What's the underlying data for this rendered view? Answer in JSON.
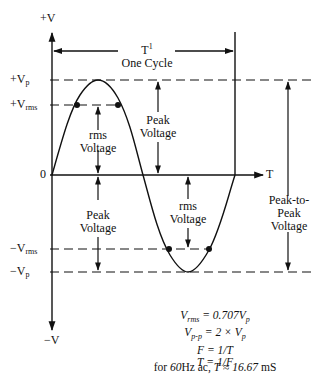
{
  "axes": {
    "y_top": "+V",
    "y_bottom": "−V",
    "x_label": "T",
    "zero": "0"
  },
  "levels": {
    "pos_peak": {
      "prefix": "+V",
      "sub": "p"
    },
    "pos_rms": {
      "prefix": "+V",
      "sub": "rms"
    },
    "neg_rms": {
      "prefix": "−V",
      "sub": "rms"
    },
    "neg_peak": {
      "prefix": "−V",
      "sub": "p"
    }
  },
  "annotations": {
    "cycle_title": "T",
    "cycle_sup": "1",
    "cycle_sub": "One Cycle",
    "rms_voltage_top": [
      "rms",
      "Voltage"
    ],
    "peak_voltage_top": [
      "Peak",
      "Voltage"
    ],
    "peak_voltage_bottom": [
      "Peak",
      "Voltage"
    ],
    "rms_voltage_bottom": [
      "rms",
      "Voltage"
    ],
    "peak_to_peak": [
      "Peak-to-",
      "Peak",
      "Voltage"
    ]
  },
  "formulas": [
    {
      "lhs": "V",
      "lhs_sub": "rms",
      "rhs": "= 0.707V",
      "rhs_sub": "p"
    },
    {
      "lhs": "V",
      "lhs_sub": "p-p",
      "rhs": "= 2 × V",
      "rhs_sub": "p"
    },
    {
      "lhs": "F",
      "lhs_sub": "",
      "rhs": "= 1/T",
      "rhs_sub": ""
    },
    {
      "lhs": "T",
      "lhs_sub": "",
      "rhs": "= 1/F",
      "rhs_sub": ""
    }
  ],
  "footnote": {
    "prefix": "for ",
    "freq": "60",
    "unit": "Hz ac, ",
    "var": "T",
    "approx": " ≈ ",
    "value": "16.67",
    "suffix": " mS"
  }
}
